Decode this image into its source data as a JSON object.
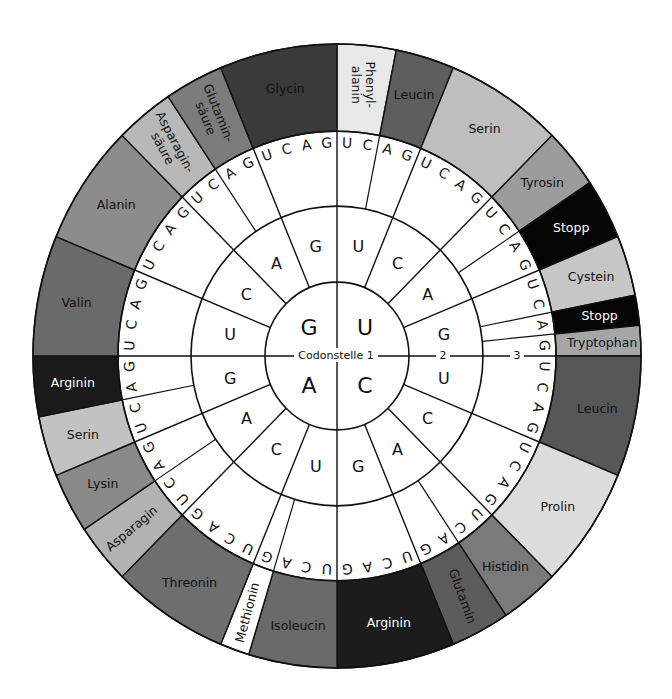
{
  "diagram": {
    "center_labels": {
      "position_1": "Codonstelle 1",
      "position_2": "2",
      "position_3": "3"
    },
    "bases_order_clockwise": [
      "U",
      "C",
      "A",
      "G"
    ],
    "quadrants": [
      {
        "first_base": "U",
        "start_deg": 0,
        "second_bases": [
          "U",
          "C",
          "A",
          "G"
        ]
      },
      {
        "first_base": "C",
        "start_deg": 90,
        "second_bases": [
          "U",
          "C",
          "A",
          "G"
        ]
      },
      {
        "first_base": "A",
        "start_deg": 180,
        "second_bases": [
          "U",
          "C",
          "A",
          "G"
        ]
      },
      {
        "first_base": "G",
        "start_deg": 270,
        "second_bases": [
          "U",
          "C",
          "A",
          "G"
        ]
      }
    ],
    "amino_acids": [
      {
        "name": "Phenyl-\nalanin",
        "codons": [
          "UUU",
          "UUC"
        ],
        "start": 0,
        "count": 2,
        "color": "#e8e8e8",
        "text_color": "#111111",
        "rotate": 90
      },
      {
        "name": "Leucin",
        "codons": [
          "UUA",
          "UUG"
        ],
        "start": 2,
        "count": 2,
        "color": "#5e5e5e",
        "text_color": "#111111",
        "rotate": 0
      },
      {
        "name": "Serin",
        "codons": [
          "UCU",
          "UCC",
          "UCA",
          "UCG"
        ],
        "start": 4,
        "count": 4,
        "color": "#bebebe",
        "text_color": "#111111",
        "rotate": 0
      },
      {
        "name": "Tyrosin",
        "codons": [
          "UAU",
          "UAC"
        ],
        "start": 8,
        "count": 2,
        "color": "#9c9c9c",
        "text_color": "#111111",
        "rotate": 0
      },
      {
        "name": "Stopp",
        "codons": [
          "UAA",
          "UAG"
        ],
        "start": 10,
        "count": 2,
        "color": "#050505",
        "text_color": "#ffffff",
        "rotate": 0
      },
      {
        "name": "Cystein",
        "codons": [
          "UGU",
          "UGC"
        ],
        "start": 12,
        "count": 2,
        "color": "#c6c6c6",
        "text_color": "#111111",
        "rotate": 0
      },
      {
        "name": "Stopp",
        "codons": [
          "UGA"
        ],
        "start": 14,
        "count": 1,
        "color": "#050505",
        "text_color": "#ffffff",
        "rotate": 0
      },
      {
        "name": "Tryptophan",
        "codons": [
          "UGG"
        ],
        "start": 15,
        "count": 1,
        "color": "#a6a6a6",
        "text_color": "#111111",
        "rotate": 0
      },
      {
        "name": "Leucin",
        "codons": [
          "CUU",
          "CUC",
          "CUA",
          "CUG"
        ],
        "start": 16,
        "count": 4,
        "color": "#575757",
        "text_color": "#111111",
        "rotate": 0
      },
      {
        "name": "Prolin",
        "codons": [
          "CCU",
          "CCC",
          "CCA",
          "CCG"
        ],
        "start": 20,
        "count": 4,
        "color": "#dcdcdc",
        "text_color": "#111111",
        "rotate": 0
      },
      {
        "name": "Histidin",
        "codons": [
          "CAU",
          "CAC"
        ],
        "start": 24,
        "count": 2,
        "color": "#7a7a7a",
        "text_color": "#111111",
        "rotate": 0
      },
      {
        "name": "Glutamin",
        "codons": [
          "CAA",
          "CAG"
        ],
        "start": 26,
        "count": 2,
        "color": "#5c5c5c",
        "text_color": "#111111",
        "rotate": 70
      },
      {
        "name": "Arginin",
        "codons": [
          "CGU",
          "CGC",
          "CGA",
          "CGG"
        ],
        "start": 28,
        "count": 4,
        "color": "#1c1c1c",
        "text_color": "#ffffff",
        "rotate": 0
      },
      {
        "name": "Isoleucin",
        "codons": [
          "AUU",
          "AUC",
          "AUA"
        ],
        "start": 32,
        "count": 3,
        "color": "#6a6a6a",
        "text_color": "#111111",
        "rotate": 0
      },
      {
        "name": "Methionin",
        "codons": [
          "AUG"
        ],
        "start": 35,
        "count": 1,
        "color": "#ffffff",
        "text_color": "#111111",
        "rotate": -75
      },
      {
        "name": "Threonin",
        "codons": [
          "ACU",
          "ACC",
          "ACA",
          "ACG"
        ],
        "start": 36,
        "count": 4,
        "color": "#6e6e6e",
        "text_color": "#111111",
        "rotate": 0
      },
      {
        "name": "Asparagin",
        "codons": [
          "AAU",
          "AAC"
        ],
        "start": 40,
        "count": 2,
        "color": "#b2b2b2",
        "text_color": "#111111",
        "rotate": -40
      },
      {
        "name": "Lysin",
        "codons": [
          "AAA",
          "AAG"
        ],
        "start": 42,
        "count": 2,
        "color": "#8a8a8a",
        "text_color": "#111111",
        "rotate": 0
      },
      {
        "name": "Serin",
        "codons": [
          "AGU",
          "AGC"
        ],
        "start": 44,
        "count": 2,
        "color": "#c2c2c2",
        "text_color": "#111111",
        "rotate": 0
      },
      {
        "name": "Arginin",
        "codons": [
          "AGA",
          "AGG"
        ],
        "start": 46,
        "count": 2,
        "color": "#1a1a1a",
        "text_color": "#ffffff",
        "rotate": 0
      },
      {
        "name": "Valin",
        "codons": [
          "GUU",
          "GUC",
          "GUA",
          "GUG"
        ],
        "start": 48,
        "count": 4,
        "color": "#6a6a6a",
        "text_color": "#111111",
        "rotate": 0
      },
      {
        "name": "Alanin",
        "codons": [
          "GCU",
          "GCC",
          "GCA",
          "GCG"
        ],
        "start": 52,
        "count": 4,
        "color": "#8c8c8c",
        "text_color": "#111111",
        "rotate": 0
      },
      {
        "name": "Asparagin-\nsäure",
        "codons": [
          "GAU",
          "GAC"
        ],
        "start": 56,
        "count": 2,
        "color": "#b8b8b8",
        "text_color": "#111111",
        "rotate": 62
      },
      {
        "name": "Glutamin-\nsäure",
        "codons": [
          "GAA",
          "GAG"
        ],
        "start": 58,
        "count": 2,
        "color": "#7c7c7c",
        "text_color": "#111111",
        "rotate": 68
      },
      {
        "name": "Glycin",
        "codons": [
          "GGU",
          "GGC",
          "GGA",
          "GGG"
        ],
        "start": 60,
        "count": 4,
        "color": "#3a3a3a",
        "text_color": "#111111",
        "rotate": 0
      }
    ]
  }
}
